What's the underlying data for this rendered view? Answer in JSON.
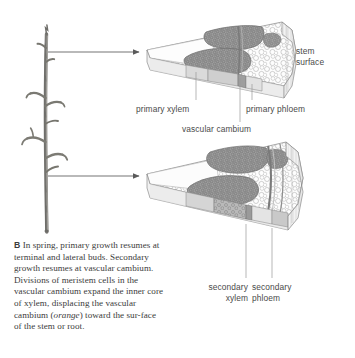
{
  "figure": {
    "panel_letter": "B",
    "background": "#ffffff",
    "ink": "#4a4a4a"
  },
  "specimen": {
    "name": "woody-twig-photograph",
    "description": "grayscale photograph of a bare woody twig with lateral branches"
  },
  "callouts": [
    {
      "name": "upper-callout-arrow",
      "from_x": 48,
      "from_y": 52,
      "to_x": 142,
      "to_y": 52
    },
    {
      "name": "lower-callout-arrow",
      "from_x": 48,
      "from_y": 176,
      "to_x": 142,
      "to_y": 176
    }
  ],
  "upper_wedge": {
    "name": "primary-growth-wedge",
    "title": "stem wedge showing primary growth",
    "labels": {
      "stem_surface": "stem\nsurface",
      "primary_xylem": "primary xylem",
      "primary_phloem": "primary phloem",
      "vascular_cambium": "vascular cambium"
    }
  },
  "lower_wedge": {
    "name": "secondary-growth-wedge",
    "title": "stem wedge showing secondary growth",
    "labels": {
      "secondary_xylem": "secondary\nxylem",
      "secondary_phloem": "secondary\nphloem"
    }
  },
  "caption": {
    "letter": "B",
    "text_before_italic": "In spring, primary growth resumes at terminal and lateral buds. Secondary growth resumes at vascular cambium. Divisions of meristem cells in the vascular cambium expand the inner core of xylem, displacing the vascular cambium (",
    "italic_word": "orange",
    "text_after_italic": ") toward the sur-face of the stem or root."
  },
  "colors": {
    "cortex_fill": "#fbfbfb",
    "cell_outline": "#9a9a9a",
    "bundle_dark": "#8d8d8d",
    "bundle_outline": "#6f6f6f",
    "side_face": "#efefef",
    "side_face_shadow": "#d8d8d8",
    "leader_line": "#8a8a8a",
    "twig_bark": "#7b7a76"
  }
}
